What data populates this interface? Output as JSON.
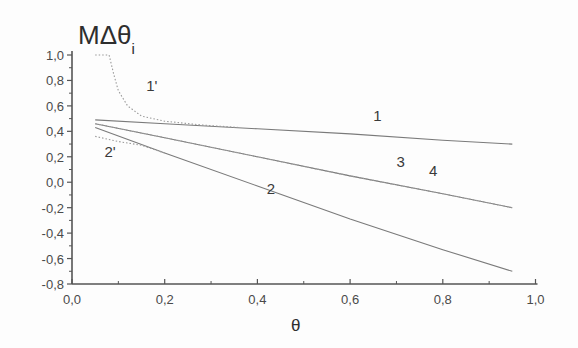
{
  "chart_data": {
    "type": "line",
    "title": "",
    "xlabel": "θ",
    "ylabel": "MΔθ_i",
    "ylabel_main": "MΔθ",
    "ylabel_sub": "i",
    "xlim": [
      0.0,
      1.0
    ],
    "ylim": [
      -0.8,
      1.0
    ],
    "grid": false,
    "legend": "none (curves labeled inline)",
    "x_ticks": [
      "0,0",
      "0,2",
      "0,4",
      "0,6",
      "0,8",
      "1,0"
    ],
    "x_tick_values": [
      0.0,
      0.2,
      0.4,
      0.6,
      0.8,
      1.0
    ],
    "y_ticks": [
      "1,0",
      "0,8",
      "0,6",
      "0,4",
      "0,2",
      "0,0",
      "-0,2",
      "-0,4",
      "-0,6",
      "-0,8"
    ],
    "y_tick_values": [
      1.0,
      0.8,
      0.6,
      0.4,
      0.2,
      0.0,
      -0.2,
      -0.4,
      -0.6,
      -0.8
    ],
    "series": [
      {
        "name": "1",
        "style": "solid",
        "x": [
          0.05,
          0.2,
          0.4,
          0.6,
          0.8,
          0.95
        ],
        "y": [
          0.49,
          0.46,
          0.42,
          0.38,
          0.33,
          0.3
        ]
      },
      {
        "name": "1'",
        "style": "dotted",
        "x": [
          0.05,
          0.08,
          0.09,
          0.1,
          0.12,
          0.15,
          0.2,
          0.28,
          0.36
        ],
        "y": [
          1.0,
          1.0,
          0.85,
          0.72,
          0.6,
          0.52,
          0.48,
          0.45,
          0.43
        ]
      },
      {
        "name": "2",
        "style": "solid",
        "x": [
          0.05,
          0.2,
          0.4,
          0.6,
          0.8,
          0.95
        ],
        "y": [
          0.43,
          0.23,
          -0.03,
          -0.29,
          -0.53,
          -0.7
        ]
      },
      {
        "name": "2'",
        "style": "dotted",
        "x": [
          0.05,
          0.1,
          0.15,
          0.2
        ],
        "y": [
          0.36,
          0.32,
          0.29,
          0.23
        ]
      },
      {
        "name": "3",
        "style": "solid",
        "x": [
          0.05,
          0.2,
          0.4,
          0.6,
          0.8,
          0.95
        ],
        "y": [
          0.46,
          0.35,
          0.2,
          0.05,
          -0.09,
          -0.2
        ]
      },
      {
        "name": "4",
        "style": "dotted",
        "x": [
          0.05,
          0.2,
          0.4,
          0.6,
          0.8,
          0.95
        ],
        "y": [
          0.46,
          0.35,
          0.2,
          0.05,
          -0.09,
          -0.2
        ]
      }
    ],
    "annotations": [
      {
        "text": "1'",
        "x": 0.16,
        "y": 0.72
      },
      {
        "text": "1",
        "x": 0.65,
        "y": 0.48
      },
      {
        "text": "3",
        "x": 0.7,
        "y": 0.12
      },
      {
        "text": "4",
        "x": 0.77,
        "y": 0.05
      },
      {
        "text": "2",
        "x": 0.42,
        "y": -0.09
      },
      {
        "text": "2'",
        "x": 0.07,
        "y": 0.2
      }
    ]
  }
}
